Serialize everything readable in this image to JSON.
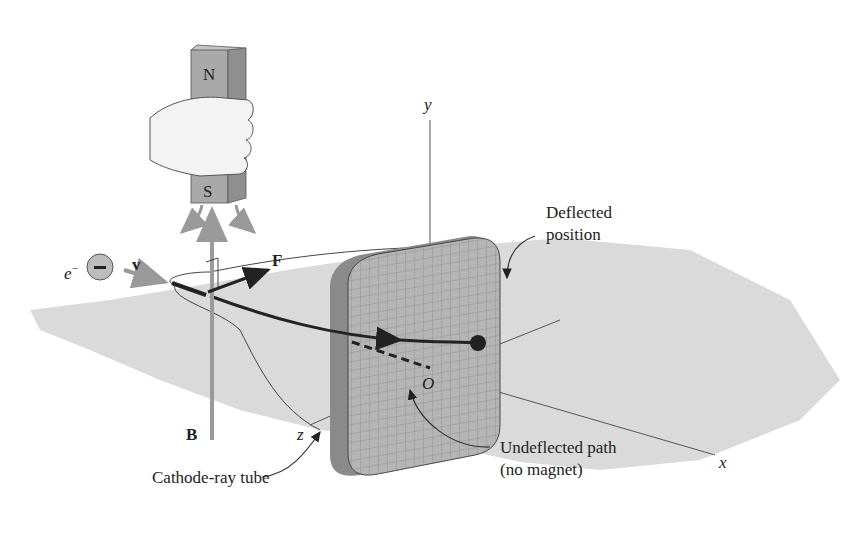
{
  "figure": {
    "type": "cathode-ray tube deflection by a bar magnet",
    "colors": {
      "background": "#ffffff",
      "ground": "#d9d9d9",
      "magnet": "#a9a9a9",
      "magnet_side": "#8f8f8f",
      "screen": "#b5b5b5",
      "screen_rim": "#8a8a8a",
      "grid": "#8c8c8c",
      "beam": "#222222",
      "vectors": "#9a9a9a",
      "axes": "#555555",
      "text": "#222222"
    }
  },
  "labels": {
    "magnet_north": "N",
    "magnet_south": "S",
    "electron": "e",
    "electron_superscript": "−",
    "electron_charge_symbol": "−",
    "velocity": "v",
    "force": "F",
    "field": "B",
    "axis_x": "x",
    "axis_y": "y",
    "axis_z": "z",
    "origin": "O",
    "deflected_line1": "Deflected",
    "deflected_line2": "position",
    "undeflected_line1": "Undeflected path",
    "undeflected_line2": "(no magnet)",
    "tube": "Cathode-ray tube"
  }
}
